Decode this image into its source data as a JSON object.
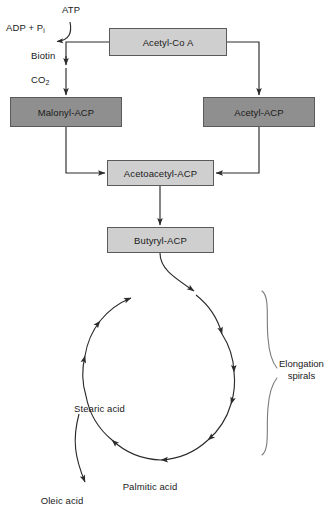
{
  "diagram": {
    "colors": {
      "light_box_fill": "#cfcfcf",
      "dark_box_fill": "#8f8f8f",
      "box_border": "#5a5a5a",
      "line": "#2b2b2b",
      "bracket": "#7a7a7a",
      "text": "#1a1a1a",
      "background": "#ffffff"
    },
    "nodes": [
      {
        "id": "acetyl_coa",
        "label": "Acetyl-Co A",
        "shade": "light",
        "x": 109,
        "y": 28,
        "w": 118,
        "h": 28
      },
      {
        "id": "malonyl_acp",
        "label": "Malonyl-ACP",
        "shade": "dark",
        "x": 10,
        "y": 97,
        "w": 112,
        "h": 30
      },
      {
        "id": "acetyl_acp",
        "label": "Acetyl-ACP",
        "shade": "dark",
        "x": 203,
        "y": 97,
        "w": 112,
        "h": 30
      },
      {
        "id": "acetoacetyl_acp",
        "label": "Acetoacetyl-ACP",
        "shade": "light",
        "x": 107,
        "y": 160,
        "w": 107,
        "h": 26
      },
      {
        "id": "butyryl_acp",
        "label": "Butyryl-ACP",
        "shade": "light",
        "x": 107,
        "y": 227,
        "w": 107,
        "h": 26
      }
    ],
    "cofactor_labels": [
      {
        "id": "atp",
        "text": "ATP",
        "x": 62,
        "y": 4
      },
      {
        "id": "adp_pi",
        "text": "ADP + P",
        "sub": "i",
        "x": 6,
        "y": 22
      },
      {
        "id": "biotin",
        "text": "Biotin",
        "x": 31,
        "y": 50
      },
      {
        "id": "co2",
        "text": "CO",
        "sub": "2",
        "x": 31,
        "y": 74
      }
    ],
    "product_labels": [
      {
        "id": "stearic_acid",
        "text": "Stearic acid",
        "x": 74,
        "y": 403
      },
      {
        "id": "palmitic_acid",
        "text": "Palmitic acid",
        "x": 150,
        "y": 481
      },
      {
        "id": "oleic_acid",
        "text": "Oleic acid",
        "x": 62,
        "y": 495
      }
    ],
    "bracket": {
      "id": "elongation_spirals_bracket",
      "label_line1": "Elongation",
      "label_line2": "spirals",
      "label_x": 283,
      "label_y": 358
    },
    "cycle": {
      "id": "elongation_cycle",
      "center_x": 160,
      "center_y": 385,
      "radius": 75,
      "direction": "clockwise",
      "arrowhead_count": 9
    }
  }
}
